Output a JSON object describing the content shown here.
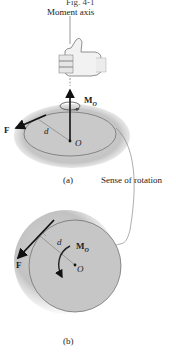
{
  "figure": {
    "caption": "Fig. 4-1",
    "annotations": {
      "moment_axis": "Moment axis",
      "sense_of_rotation": "Sense of rotation"
    },
    "part_a": {
      "label": "(a)",
      "force": "F",
      "distance": "d",
      "point": "O",
      "moment": "M",
      "moment_sub": "O"
    },
    "part_b": {
      "label": "(b)",
      "force": "F",
      "distance": "d",
      "point": "O",
      "moment": "M",
      "moment_sub": "O"
    },
    "colors": {
      "disk_fill": "#c8c8c8",
      "outline": "#555555",
      "arrow": "#111111"
    }
  }
}
